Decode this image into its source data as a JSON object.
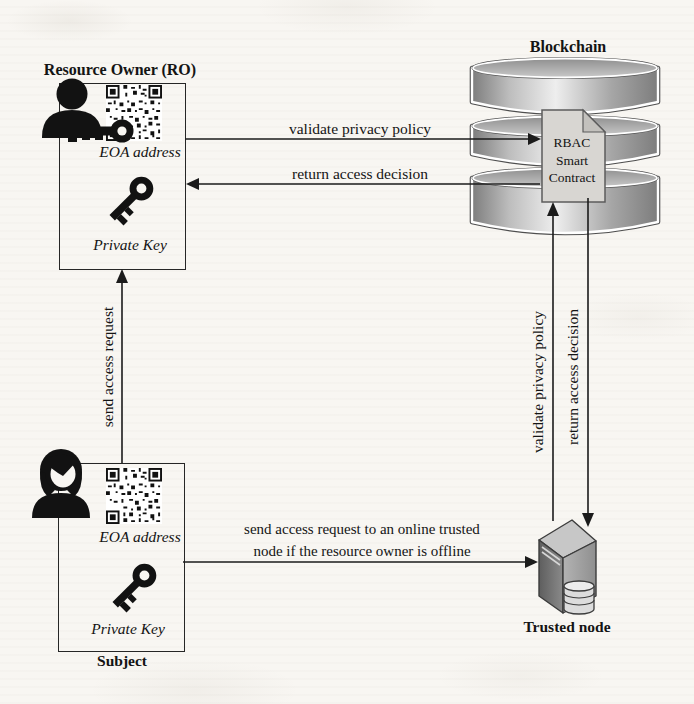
{
  "blockchain": {
    "title": "Blockchain",
    "smart_contract": "RBAC\nSmart\nContract"
  },
  "resource_owner": {
    "title": "Resource Owner (RO)",
    "eoa_label": "EOA address",
    "private_key_label": "Private Key"
  },
  "subject": {
    "title": "Subject",
    "eoa_label": "EOA address",
    "private_key_label": "Private Key"
  },
  "trusted_node": {
    "title": "Trusted node"
  },
  "arrows": {
    "validate_policy_to_contract": "validate privacy policy",
    "return_decision_to_owner": "return access decision",
    "send_access_request": "send access request",
    "send_offline_request": "send access request to an online trusted\nnode if the resource owner is offline",
    "validate_policy_from_node": "validate privacy policy",
    "return_decision_to_node": "return access decision"
  },
  "icons": {
    "resource_owner": "person-with-key-icon",
    "subject": "woman-icon",
    "eoa_address": "qr-code-icon",
    "private_key": "key-icon",
    "blockchain": "database-stack-icon",
    "smart_contract": "document-icon",
    "trusted_node": "server-icon"
  },
  "colors": {
    "background": "#f8f6f2",
    "line": "#1b1b1b",
    "text": "#141414",
    "cylinder_light": "#eeeeee",
    "cylinder_dark": "#7d7d7d",
    "document_fill": "#d8d6d2",
    "server_left_face": "#6e6e6e",
    "server_right_face": "#a6a6a6",
    "server_top_face": "#c7c7c7"
  }
}
